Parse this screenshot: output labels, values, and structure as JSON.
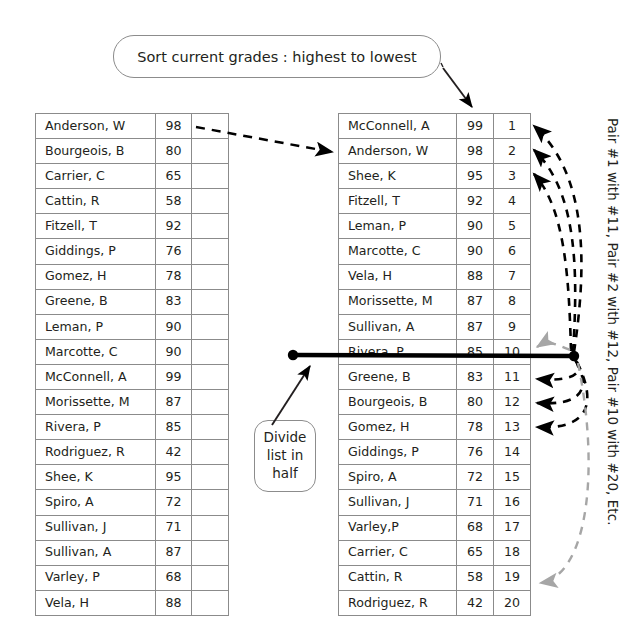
{
  "callouts": {
    "sort": "Sort current grades : highest to lowest",
    "divide_line1": "Divide",
    "divide_line2": "list in",
    "divide_line3": "half"
  },
  "side_note": "Pair #1 with #11, Pair #2 with #12, Pair #10 with #20, Etc.",
  "left_table": {
    "title": "Unsorted class list",
    "columns": [
      "name",
      "grade",
      "blank"
    ],
    "rows": [
      {
        "name": "Anderson, W",
        "grade": "98",
        "blank": ""
      },
      {
        "name": "Bourgeois, B",
        "grade": "80",
        "blank": ""
      },
      {
        "name": "Carrier, C",
        "grade": "65",
        "blank": ""
      },
      {
        "name": "Cattin, R",
        "grade": "58",
        "blank": ""
      },
      {
        "name": "Fitzell, T",
        "grade": "92",
        "blank": ""
      },
      {
        "name": "Giddings, P",
        "grade": "76",
        "blank": ""
      },
      {
        "name": "Gomez, H",
        "grade": "78",
        "blank": ""
      },
      {
        "name": "Greene, B",
        "grade": "83",
        "blank": ""
      },
      {
        "name": "Leman, P",
        "grade": "90",
        "blank": ""
      },
      {
        "name": "Marcotte, C",
        "grade": "90",
        "blank": ""
      },
      {
        "name": "McConnell, A",
        "grade": "99",
        "blank": ""
      },
      {
        "name": "Morissette, M",
        "grade": "87",
        "blank": ""
      },
      {
        "name": "Rivera, P",
        "grade": "85",
        "blank": ""
      },
      {
        "name": "Rodriguez, R",
        "grade": "42",
        "blank": ""
      },
      {
        "name": "Shee, K",
        "grade": "95",
        "blank": ""
      },
      {
        "name": "Spiro, A",
        "grade": "72",
        "blank": ""
      },
      {
        "name": "Sullivan, J",
        "grade": "71",
        "blank": ""
      },
      {
        "name": "Sullivan, A",
        "grade": "87",
        "blank": ""
      },
      {
        "name": "Varley, P",
        "grade": "68",
        "blank": ""
      },
      {
        "name": "Vela, H",
        "grade": "88",
        "blank": ""
      }
    ]
  },
  "right_table": {
    "title": "Sorted class list with ranks",
    "columns": [
      "name",
      "grade",
      "rank"
    ],
    "rows": [
      {
        "name": "McConnell, A",
        "grade": "99",
        "rank": "1"
      },
      {
        "name": "Anderson, W",
        "grade": "98",
        "rank": "2"
      },
      {
        "name": "Shee, K",
        "grade": "95",
        "rank": "3"
      },
      {
        "name": "Fitzell, T",
        "grade": "92",
        "rank": "4"
      },
      {
        "name": "Leman, P",
        "grade": "90",
        "rank": "5"
      },
      {
        "name": "Marcotte, C",
        "grade": "90",
        "rank": "6"
      },
      {
        "name": "Vela, H",
        "grade": "88",
        "rank": "7"
      },
      {
        "name": "Morissette, M",
        "grade": "87",
        "rank": "8"
      },
      {
        "name": "Sullivan, A",
        "grade": "87",
        "rank": "9"
      },
      {
        "name": "Rivera, P",
        "grade": "85",
        "rank": "10"
      },
      {
        "name": "Greene, B",
        "grade": "83",
        "rank": "11"
      },
      {
        "name": "Bourgeois, B",
        "grade": "80",
        "rank": "12"
      },
      {
        "name": "Gomez, H",
        "grade": "78",
        "rank": "13"
      },
      {
        "name": "Giddings, P",
        "grade": "76",
        "rank": "14"
      },
      {
        "name": "Spiro, A",
        "grade": "72",
        "rank": "15"
      },
      {
        "name": "Sullivan, J",
        "grade": "71",
        "rank": "16"
      },
      {
        "name": "Varley,P",
        "grade": "68",
        "rank": "17"
      },
      {
        "name": "Carrier, C",
        "grade": "65",
        "rank": "18"
      },
      {
        "name": "Cattin, R",
        "grade": "58",
        "rank": "19"
      },
      {
        "name": "Rodriguez, R",
        "grade": "42",
        "rank": "20"
      }
    ]
  },
  "colors": {
    "ink": "#231f20",
    "table_border": "#8b8b8b",
    "bubble_border": "#8c8c8c",
    "divider": "#000000",
    "gray_arrow": "#a6a6a6"
  }
}
